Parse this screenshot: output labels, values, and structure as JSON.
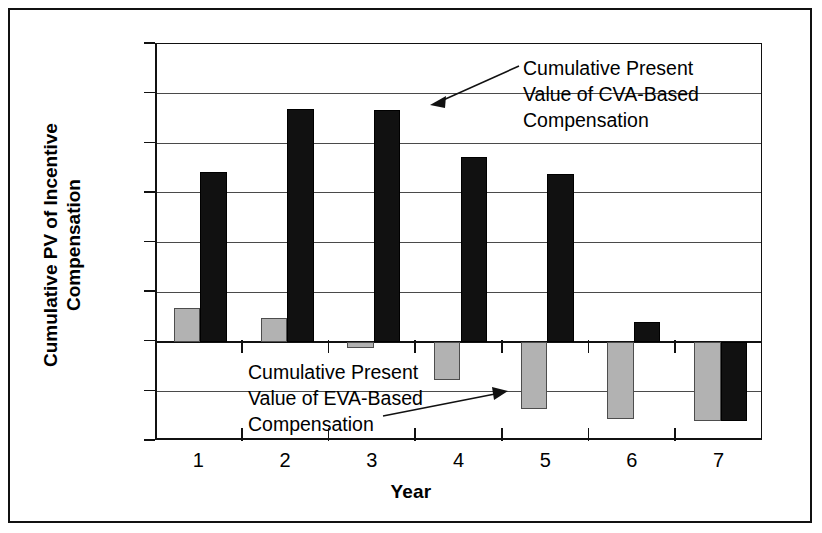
{
  "chart_data": {
    "type": "bar",
    "title": "",
    "xlabel": "Year",
    "ylabel": "Cumulative PV of Incentive Compensation",
    "ylabel_line1": "Cumulative PV of Incentive",
    "ylabel_line2": "Compensation",
    "categories": [
      "1",
      "2",
      "3",
      "4",
      "5",
      "6",
      "7"
    ],
    "ylim": [
      -4.0,
      12.0
    ],
    "ytick_values": [
      12.0,
      10.0,
      8.0,
      6.0,
      4.0,
      2.0,
      0.0,
      -2.0,
      -4.0
    ],
    "ytick_labels": [
      "$12.00",
      "$10.00",
      "$8.00",
      "$6.00",
      "$4.00",
      "$2.00",
      "$0.00",
      "($2.00)",
      "($4.00)"
    ],
    "grid": true,
    "legend": "none",
    "series": [
      {
        "name": "Cumulative Present Value of EVA-Based Compensation",
        "color": "#b2b2b2",
        "values": [
          1.35,
          0.95,
          -0.25,
          -1.55,
          -2.7,
          -3.1,
          -3.2
        ]
      },
      {
        "name": "Cumulative Present Value of CVA-Based Compensation",
        "color": "#111111",
        "values": [
          6.85,
          9.4,
          9.35,
          7.45,
          6.75,
          0.8,
          -3.2
        ]
      }
    ],
    "annotations": [
      {
        "id": "cva-annotation",
        "line1": "Cumulative Present",
        "line2": "Value of CVA-Based",
        "line3": "Compensation"
      },
      {
        "id": "eva-annotation",
        "line1": "Cumulative Present",
        "line2": "Value of EVA-Based",
        "line3": "Compensation"
      }
    ]
  },
  "yaxis": {
    "labels": [
      "$12.00",
      "$10.00",
      "$8.00",
      "$6.00",
      "$4.00",
      "$2.00",
      "$0.00",
      "($2.00)",
      "($4.00)"
    ],
    "title_line1": "Cumulative PV of Incentive",
    "title_line2": "Compensation"
  },
  "xaxis": {
    "title": "Year",
    "labels": [
      "1",
      "2",
      "3",
      "4",
      "5",
      "6",
      "7"
    ]
  },
  "annotations": {
    "cva": {
      "line1": "Cumulative Present",
      "line2": "Value of CVA-Based",
      "line3": "Compensation"
    },
    "eva": {
      "line1": "Cumulative Present",
      "line2": "Value of EVA-Based",
      "line3": "Compensation"
    }
  },
  "colors": {
    "eva_bar": "#b2b2b2",
    "cva_bar": "#111111",
    "grid": "#4a4a4a",
    "axis": "#111111",
    "background": "#ffffff"
  }
}
